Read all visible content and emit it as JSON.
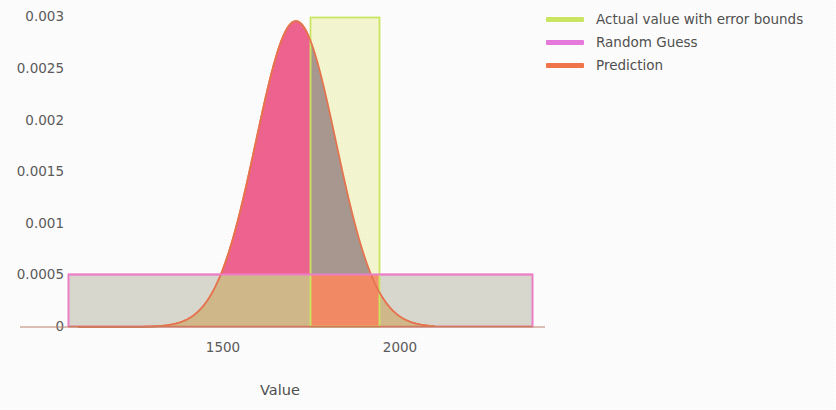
{
  "chart_data": {
    "type": "area",
    "title": "",
    "xlabel": "Value",
    "ylabel": "",
    "xlim": [
      1091,
      2097
    ],
    "ylim": [
      0,
      0.0031
    ],
    "grid": false,
    "legend_position": "right",
    "xticks": [
      {
        "value": 1500,
        "label": "1500"
      },
      {
        "value": 2000,
        "label": "2000"
      }
    ],
    "yticks": [
      {
        "value": 0.003,
        "label": "0.003"
      },
      {
        "value": 0.0025,
        "label": "0.0025"
      },
      {
        "value": 0.002,
        "label": "0.002"
      },
      {
        "value": 0.0015,
        "label": "0.0015"
      },
      {
        "value": 0.001,
        "label": "0.001"
      },
      {
        "value": 0.0005,
        "label": "0.0005"
      },
      {
        "value": 0,
        "label": "0"
      }
    ],
    "series": [
      {
        "name": "Actual value with error bounds",
        "type": "vertical-band",
        "color": "#cce860",
        "fill": "#f4f7c8",
        "x_low": 1746,
        "x_high": 1944,
        "y_low": 0,
        "y_high": 0.003
      },
      {
        "name": "Random Guess",
        "type": "uniform-density",
        "color": "#e87add",
        "fill": "#d9d9d0",
        "x_low": 1110,
        "x_high": 2025,
        "density": 0.0005
      },
      {
        "name": "Prediction",
        "type": "normal-density",
        "color": "#f4744a",
        "fill": "#f0628f",
        "mean": 1706,
        "std": 113,
        "peak": 0.00296,
        "x_low": 1091,
        "x_high": 2097
      }
    ]
  },
  "legend": {
    "items": [
      {
        "label": "Actual value with error bounds",
        "color": "#cce860"
      },
      {
        "label": "Random Guess",
        "color": "#e87add"
      },
      {
        "label": "Prediction",
        "color": "#f4744a"
      }
    ]
  },
  "axes": {
    "x_title": "Value",
    "x_tick_labels": [
      "1500",
      "2000"
    ],
    "y_tick_labels": [
      "0.003",
      "0.0025",
      "0.002",
      "0.0015",
      "0.001",
      "0.0005",
      "0"
    ]
  },
  "colors": {
    "prediction_fill": "#f0628f",
    "prediction_edge": "#f4744a",
    "random_guess_fill": "#d9d9d0",
    "random_guess_edge": "#e87add",
    "actual_band_fill": "#f4f7c8",
    "actual_band_edge": "#cce860",
    "overlap_pred_band": "#a89890",
    "overlap_pred_guess": "#d2b98a",
    "overlap_band_guess": "#f8936f",
    "text": "#555555"
  }
}
